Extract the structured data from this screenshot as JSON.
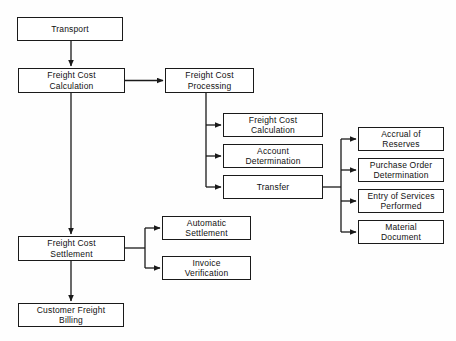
{
  "diagram": {
    "background_color": "#fefefe",
    "box_border_color": "#1a1a1a",
    "box_fill_color": "#ffffff",
    "connector_color": "#1a1a1a",
    "nodes": [
      {
        "id": "transport",
        "label": "Transport",
        "x": 17,
        "y": 17,
        "w": 106,
        "h": 24
      },
      {
        "id": "freight_cost_calculation_main",
        "label": "Freight Cost\nCalculation",
        "x": 18,
        "y": 68,
        "w": 107,
        "h": 25
      },
      {
        "id": "freight_cost_processing",
        "label": "Freight Cost\nProcessing",
        "x": 165,
        "y": 68,
        "w": 89,
        "h": 25
      },
      {
        "id": "freight_cost_calculation_sub",
        "label": "Freight Cost\nCalculation",
        "x": 223,
        "y": 113,
        "w": 100,
        "h": 24
      },
      {
        "id": "account_determination",
        "label": "Account\nDetermination",
        "x": 223,
        "y": 144,
        "w": 100,
        "h": 24
      },
      {
        "id": "transfer",
        "label": "Transfer",
        "x": 223,
        "y": 175,
        "w": 100,
        "h": 24
      },
      {
        "id": "accrual_of_reserves",
        "label": "Accrual of\nReserves",
        "x": 358,
        "y": 127,
        "w": 86,
        "h": 24
      },
      {
        "id": "purchase_order_determination",
        "label": "Purchase Order\nDetermination",
        "x": 358,
        "y": 158,
        "w": 86,
        "h": 24
      },
      {
        "id": "entry_of_services_performed",
        "label": "Entry of Services\nPerformed",
        "x": 358,
        "y": 189,
        "w": 86,
        "h": 24
      },
      {
        "id": "material_document",
        "label": "Material\nDocument",
        "x": 358,
        "y": 220,
        "w": 86,
        "h": 24
      },
      {
        "id": "freight_cost_settlement",
        "label": "Freight Cost\nSettlement",
        "x": 18,
        "y": 236,
        "w": 107,
        "h": 25
      },
      {
        "id": "automatic_settlement",
        "label": "Automatic\nSettlement",
        "x": 162,
        "y": 216,
        "w": 89,
        "h": 24
      },
      {
        "id": "invoice_verification",
        "label": "Invoice\nVerification",
        "x": 162,
        "y": 256,
        "w": 89,
        "h": 24
      },
      {
        "id": "customer_freight_billing",
        "label": "Customer Freight\nBilling",
        "x": 18,
        "y": 303,
        "w": 106,
        "h": 24
      }
    ],
    "edges": [
      {
        "id": "transport-to-calculation",
        "from": "transport",
        "to": "freight_cost_calculation_main",
        "kind": "vertical-arrow"
      },
      {
        "id": "calculation-to-processing",
        "from": "freight_cost_calculation_main",
        "to": "freight_cost_processing",
        "kind": "horizontal-arrow"
      },
      {
        "id": "processing-to-calculation-sub",
        "from": "freight_cost_processing",
        "to": "freight_cost_calculation_sub",
        "kind": "elbow-arrow"
      },
      {
        "id": "processing-to-account-determination",
        "from": "freight_cost_processing",
        "to": "account_determination",
        "kind": "elbow-arrow"
      },
      {
        "id": "processing-to-transfer",
        "from": "freight_cost_processing",
        "to": "transfer",
        "kind": "elbow-arrow"
      },
      {
        "id": "transfer-to-accrual",
        "from": "transfer",
        "to": "accrual_of_reserves",
        "kind": "elbow-arrow"
      },
      {
        "id": "transfer-to-purchase-order",
        "from": "transfer",
        "to": "purchase_order_determination",
        "kind": "elbow-arrow"
      },
      {
        "id": "transfer-to-entry-of-services",
        "from": "transfer",
        "to": "entry_of_services_performed",
        "kind": "elbow-arrow"
      },
      {
        "id": "transfer-to-material-document",
        "from": "transfer",
        "to": "material_document",
        "kind": "elbow-arrow"
      },
      {
        "id": "calculation-to-settlement",
        "from": "freight_cost_calculation_main",
        "to": "freight_cost_settlement",
        "kind": "vertical-arrow"
      },
      {
        "id": "settlement-to-automatic-settlement",
        "from": "freight_cost_settlement",
        "to": "automatic_settlement",
        "kind": "elbow-arrow"
      },
      {
        "id": "settlement-to-invoice-verification",
        "from": "freight_cost_settlement",
        "to": "invoice_verification",
        "kind": "elbow-arrow"
      },
      {
        "id": "settlement-to-customer-billing",
        "from": "freight_cost_settlement",
        "to": "customer_freight_billing",
        "kind": "vertical-arrow"
      }
    ]
  }
}
